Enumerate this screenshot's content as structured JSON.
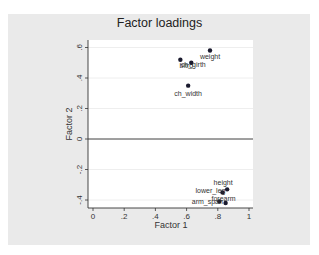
{
  "chart_data": {
    "type": "scatter",
    "title": "Factor loadings",
    "xlabel": "Factor 1",
    "ylabel": "Factor 2",
    "xlim": [
      0,
      1
    ],
    "ylim": [
      -0.4,
      0.6
    ],
    "xticks": [
      "0",
      ".2",
      ".4",
      ".6",
      ".8",
      "1"
    ],
    "yticks": [
      "-.4",
      "-.2",
      "0",
      ".2",
      ".4",
      ".6"
    ],
    "grid": true,
    "legend": "none",
    "points": [
      {
        "label": "weight",
        "x": 0.75,
        "y": 0.58
      },
      {
        "label": "bitro",
        "x": 0.56,
        "y": 0.52
      },
      {
        "label": "ch_girth",
        "x": 0.63,
        "y": 0.5
      },
      {
        "label": "ch_width",
        "x": 0.61,
        "y": 0.35
      },
      {
        "label": "height",
        "x": 0.86,
        "y": -0.33
      },
      {
        "label": "lower_leg",
        "x": 0.83,
        "y": -0.35
      },
      {
        "label": "arm_span",
        "x": 0.81,
        "y": -0.41
      },
      {
        "label": "forearm",
        "x": 0.85,
        "y": -0.42
      }
    ]
  }
}
